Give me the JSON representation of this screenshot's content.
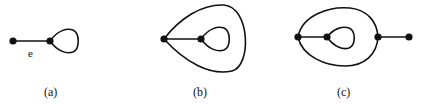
{
  "colors": {
    "stroke": "#111111",
    "node": "#111111",
    "background": "#ffffff"
  },
  "graphs": [
    {
      "id": "a",
      "caption": "(a)",
      "edge_label": "e",
      "nodes": [
        {
          "x": 13,
          "y": 41
        },
        {
          "x": 50,
          "y": 41
        }
      ],
      "edges": [
        {
          "type": "line",
          "from": 0,
          "to": 1
        },
        {
          "type": "loop",
          "at": 1,
          "reach_x": 78
        }
      ]
    },
    {
      "id": "b",
      "caption": "(b)",
      "nodes": [
        {
          "x": 164,
          "y": 39
        },
        {
          "x": 201,
          "y": 39
        }
      ],
      "edges": [
        {
          "type": "line",
          "from": 0,
          "to": 1
        },
        {
          "type": "loop",
          "at": 1,
          "reach_x": 229
        },
        {
          "type": "loop",
          "at": 0,
          "reach_x": 248
        }
      ]
    },
    {
      "id": "c",
      "caption": "(c)",
      "nodes": [
        {
          "x": 298,
          "y": 37
        },
        {
          "x": 327,
          "y": 37
        },
        {
          "x": 378,
          "y": 37
        },
        {
          "x": 409,
          "y": 37
        }
      ],
      "edges": [
        {
          "type": "line",
          "from": 0,
          "to": 1
        },
        {
          "type": "loop",
          "at": 1,
          "reach_x": 355
        },
        {
          "type": "double_edge",
          "from": 0,
          "to": 2
        },
        {
          "type": "line",
          "from": 2,
          "to": 3
        }
      ]
    }
  ]
}
